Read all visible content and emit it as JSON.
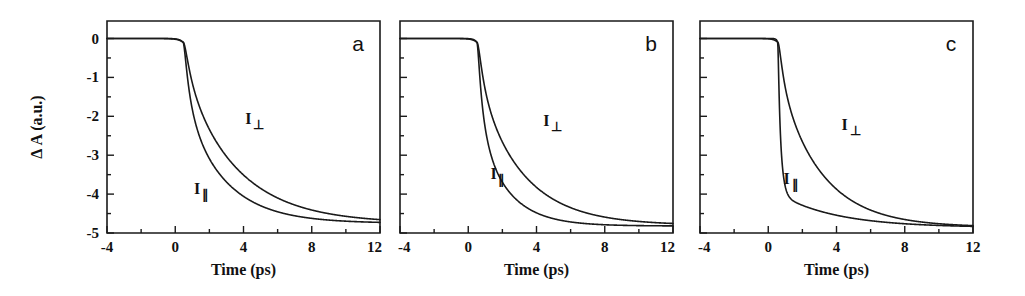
{
  "figure": {
    "background_color": "#ffffff",
    "ink_color": "#1a1a1a",
    "panel_count": 3
  },
  "chart_data": [
    {
      "type": "line",
      "panel": "a",
      "title": "",
      "xlabel": "Time (ps)",
      "ylabel": "Δ A (a.u.)",
      "xlim": [
        -4,
        12
      ],
      "ylim": [
        -5,
        0.45
      ],
      "xticks": [
        -4,
        0,
        4,
        8,
        12
      ],
      "xticklabels": [
        "-4",
        "0",
        "4",
        "8",
        "12"
      ],
      "xminor_step": 2,
      "yticks": [
        0,
        -1,
        -2,
        -3,
        -4,
        -5
      ],
      "yticklabels": [
        "0",
        "-1",
        "-2",
        "-3",
        "-4",
        "-5"
      ],
      "yminor_step": 0.5,
      "grid": false,
      "legend_position": "inline-annotation",
      "series": [
        {
          "name": "I⊥",
          "label_text": "I",
          "label_sub": "⊥",
          "label_x": 4.1,
          "label_y": -2.2,
          "onset_ps": 0.45,
          "rise_ps": 0.28,
          "amplitude": -4.75,
          "tau_ps": 3.1,
          "fast_fraction": 0.18,
          "tau_fast_ps": 0.55,
          "baseline": 0.0,
          "x": [
            -4,
            -2,
            0,
            0.5,
            0.8,
            1,
            1.5,
            2,
            3,
            4,
            5,
            6,
            7,
            8,
            9,
            10,
            11,
            12
          ],
          "y": [
            0,
            0,
            0,
            -0.1,
            -0.85,
            -1.25,
            -2.0,
            -2.55,
            -3.3,
            -3.8,
            -4.12,
            -4.33,
            -4.48,
            -4.58,
            -4.65,
            -4.7,
            -4.73,
            -4.75
          ]
        },
        {
          "name": "I∥",
          "label_text": "I",
          "label_sub": "∥",
          "label_x": 1.1,
          "label_y": -4.0,
          "onset_ps": 0.45,
          "rise_ps": 0.2,
          "amplitude": -4.75,
          "tau_ps": 2.35,
          "fast_fraction": 0.34,
          "tau_fast_ps": 0.42,
          "baseline": 0.0,
          "x": [
            -4,
            -2,
            0,
            0.5,
            0.8,
            1,
            1.5,
            2,
            3,
            4,
            5,
            6,
            7,
            8,
            9,
            10,
            11,
            12
          ],
          "y": [
            0,
            0,
            0,
            -0.12,
            -1.35,
            -1.95,
            -2.65,
            -3.1,
            -3.75,
            -4.12,
            -4.35,
            -4.5,
            -4.6,
            -4.66,
            -4.7,
            -4.73,
            -4.75,
            -4.76
          ]
        }
      ]
    },
    {
      "type": "line",
      "panel": "b",
      "title": "",
      "xlabel": "Time (ps)",
      "ylabel": "",
      "xlim": [
        -4,
        12
      ],
      "ylim": [
        -5,
        0.45
      ],
      "xticks": [
        -4,
        0,
        4,
        8,
        12
      ],
      "xticklabels": [
        "-4",
        "0",
        "4",
        "8",
        "12"
      ],
      "xminor_step": 2,
      "yticks": [
        0,
        -1,
        -2,
        -3,
        -4,
        -5
      ],
      "yticklabels": [
        "",
        "",
        "",
        "",
        "",
        ""
      ],
      "yminor_step": 0.5,
      "grid": false,
      "legend_position": "inline-annotation",
      "series": [
        {
          "name": "I⊥",
          "label_text": "I",
          "label_sub": "⊥",
          "label_x": 4.4,
          "label_y": -2.25,
          "onset_ps": 0.5,
          "rise_ps": 0.25,
          "amplitude": -4.8,
          "tau_ps": 2.6,
          "fast_fraction": 0.22,
          "tau_fast_ps": 0.45,
          "baseline": 0.0,
          "x": [
            -4,
            -2,
            0,
            0.5,
            0.8,
            1,
            1.5,
            2,
            3,
            4,
            5,
            6,
            7,
            8,
            9,
            10,
            11,
            12
          ],
          "y": [
            0,
            0,
            0,
            -0.1,
            -1.0,
            -1.5,
            -2.25,
            -2.8,
            -3.55,
            -4.0,
            -4.3,
            -4.48,
            -4.6,
            -4.68,
            -4.73,
            -4.76,
            -4.78,
            -4.8
          ]
        },
        {
          "name": "I∥",
          "label_text": "I",
          "label_sub": "∥",
          "label_x": 1.3,
          "label_y": -3.6,
          "onset_ps": 0.5,
          "rise_ps": 0.16,
          "amplitude": -4.82,
          "tau_ps": 1.7,
          "fast_fraction": 0.45,
          "tau_fast_ps": 0.35,
          "baseline": 0.0,
          "x": [
            -4,
            -2,
            0,
            0.5,
            0.8,
            1,
            1.5,
            2,
            3,
            4,
            5,
            6,
            7,
            8,
            9,
            10,
            11,
            12
          ],
          "y": [
            0,
            0,
            0,
            -0.15,
            -1.75,
            -2.45,
            -3.15,
            -3.55,
            -4.1,
            -4.4,
            -4.58,
            -4.68,
            -4.74,
            -4.77,
            -4.79,
            -4.8,
            -4.81,
            -4.82
          ]
        }
      ]
    },
    {
      "type": "line",
      "panel": "c",
      "title": "",
      "xlabel": "Time (ps)",
      "ylabel": "",
      "xlim": [
        -4,
        12
      ],
      "ylim": [
        -5,
        0.45
      ],
      "xticks": [
        -4,
        0,
        4,
        8,
        12
      ],
      "xticklabels": [
        "-4",
        "0",
        "4",
        "8",
        "12"
      ],
      "xminor_step": 2,
      "yticks": [
        0,
        -1,
        -2,
        -3,
        -4,
        -5
      ],
      "yticklabels": [
        "",
        "",
        "",
        "",
        "",
        ""
      ],
      "yminor_step": 0.5,
      "grid": false,
      "legend_position": "inline-annotation",
      "series": [
        {
          "name": "I⊥",
          "label_text": "I",
          "label_sub": "⊥",
          "label_x": 4.3,
          "label_y": -2.35,
          "onset_ps": 0.55,
          "rise_ps": 0.22,
          "amplitude": -4.85,
          "tau_ps": 2.5,
          "fast_fraction": 0.2,
          "tau_fast_ps": 0.4,
          "baseline": 0.0,
          "x": [
            -4,
            -2,
            0,
            0.5,
            0.8,
            1,
            1.5,
            2,
            3,
            4,
            5,
            6,
            7,
            8,
            9,
            10,
            11,
            12
          ],
          "y": [
            0,
            0,
            0,
            -0.08,
            -1.05,
            -1.6,
            -2.4,
            -2.95,
            -3.7,
            -4.15,
            -4.45,
            -4.6,
            -4.7,
            -4.76,
            -4.8,
            -4.82,
            -4.84,
            -4.85
          ]
        },
        {
          "name": "I∥",
          "label_text": "I",
          "label_sub": "∥",
          "label_x": 0.9,
          "label_y": -3.75,
          "onset_ps": 0.55,
          "rise_ps": 0.07,
          "amplitude": -4.86,
          "tau_ps": 3.4,
          "fast_fraction": 0.82,
          "tau_fast_ps": 0.17,
          "baseline": 0.0,
          "x": [
            -4,
            -2,
            0,
            0.5,
            0.7,
            0.85,
            1,
            1.2,
            1.5,
            2,
            3,
            4,
            5,
            6,
            7,
            8,
            9,
            10,
            11,
            12
          ],
          "y": [
            0,
            0,
            0,
            -0.1,
            -1.6,
            -2.9,
            -3.5,
            -3.85,
            -3.98,
            -4.12,
            -4.35,
            -4.5,
            -4.62,
            -4.7,
            -4.76,
            -4.8,
            -4.83,
            -4.85,
            -4.86,
            -4.86
          ]
        }
      ]
    }
  ],
  "panels": [
    {
      "letter": "a"
    },
    {
      "letter": "b"
    },
    {
      "letter": "c"
    }
  ]
}
